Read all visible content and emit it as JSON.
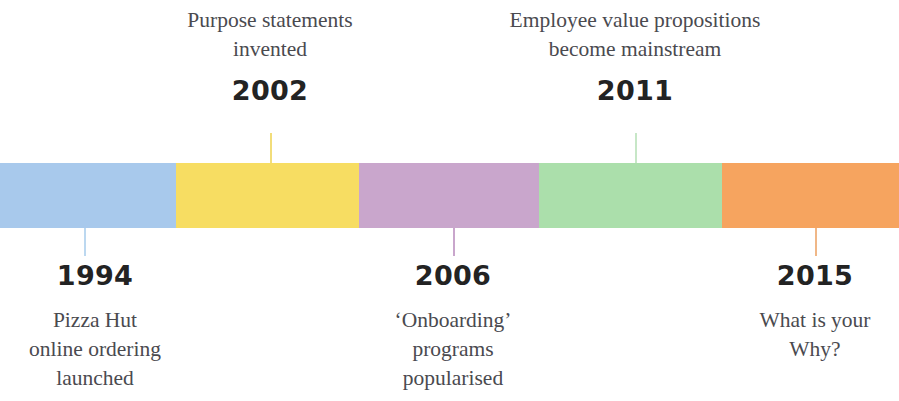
{
  "figure": {
    "type": "timeline",
    "background_color": "#ffffff",
    "bar": {
      "top": 163,
      "height": 65,
      "segments": [
        {
          "name": "segment-blue",
          "color": "#a8c9ec",
          "start_x": 0,
          "end_x": 176
        },
        {
          "name": "segment-yellow",
          "color": "#f7dd62",
          "start_x": 176,
          "end_x": 359
        },
        {
          "name": "segment-purple",
          "color": "#c9a6cc",
          "start_x": 359,
          "end_x": 539
        },
        {
          "name": "segment-green",
          "color": "#abdfab",
          "start_x": 539,
          "end_x": 722
        },
        {
          "name": "segment-orange",
          "color": "#f6a45f",
          "start_x": 722,
          "end_x": 899
        }
      ]
    }
  },
  "events": [
    {
      "id": "event-1994",
      "year": "1994",
      "description": "Pizza Hut\nonline ordering\nlaunched",
      "description_lines": [
        "Pizza Hut",
        "online ordering",
        "launched"
      ],
      "position": "below",
      "stem_color": "#bcd8f0",
      "stem_x": 84,
      "stem_top": 228,
      "stem_height": 28,
      "text_left": -25,
      "text_top": 262,
      "text_width": 240
    },
    {
      "id": "event-2002",
      "year": "2002",
      "description": "Purpose statements\ninvented",
      "description_lines": [
        "Purpose statements",
        "invented"
      ],
      "position": "above",
      "stem_color": "#f2dd7a",
      "stem_x": 270,
      "stem_top": 133,
      "stem_height": 30,
      "text_left": 125,
      "text_top": 6,
      "text_width": 290
    },
    {
      "id": "event-2006",
      "year": "2006",
      "description": "‘Onboarding’\nprograms\npopularised",
      "description_lines": [
        "‘Onboarding’",
        "programs",
        "popularised"
      ],
      "position": "below",
      "stem_color": "#c9a6cc",
      "stem_x": 453,
      "stem_top": 228,
      "stem_height": 28,
      "text_left": 333,
      "text_top": 262,
      "text_width": 240
    },
    {
      "id": "event-2011",
      "year": "2011",
      "description": "Employee value propositions\nbecome mainstream",
      "description_lines": [
        "Employee value propositions",
        "become mainstream"
      ],
      "position": "above",
      "stem_color": "#c7e7c7",
      "stem_x": 635,
      "stem_top": 133,
      "stem_height": 30,
      "text_left": 455,
      "text_top": 6,
      "text_width": 360
    },
    {
      "id": "event-2015",
      "year": "2015",
      "description": "What is your\nWhy?",
      "description_lines": [
        "What is your",
        "Why?"
      ],
      "position": "below",
      "stem_color": "#f0b787",
      "stem_x": 815,
      "stem_top": 228,
      "stem_height": 28,
      "text_left": 700,
      "text_top": 262,
      "text_width": 230
    }
  ]
}
